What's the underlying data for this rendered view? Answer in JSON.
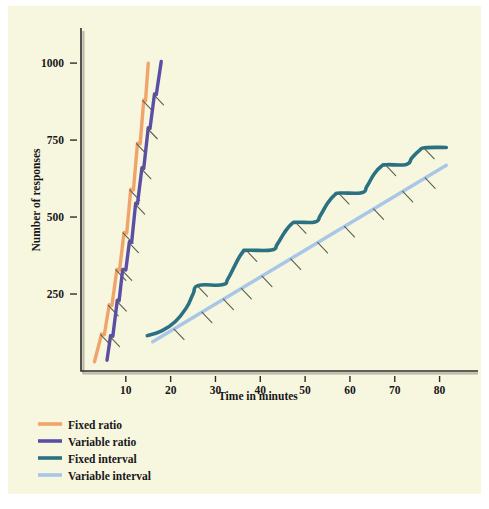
{
  "figure": {
    "background_color": "#f7f6de",
    "page_color": "#ffffff",
    "text_color": "#17171a"
  },
  "chart_data": {
    "type": "line",
    "title": "",
    "subtitle": "",
    "xlabel": "Time in minutes",
    "ylabel": "Number of responses",
    "xlim": [
      0,
      85
    ],
    "ylim": [
      0,
      1075
    ],
    "xticks": [
      10,
      20,
      30,
      40,
      50,
      60,
      70,
      80
    ],
    "xtick_labels": [
      "10",
      "20",
      "30",
      "40",
      "50",
      "60",
      "70",
      "80"
    ],
    "yticks": [
      250,
      500,
      750,
      1000
    ],
    "ytick_labels": [
      "250",
      "500",
      "750",
      "1000"
    ],
    "grid": false,
    "legend_position": "below-left",
    "annotation": "Short diagonal hatch marks on each curve indicate moments of reinforcement",
    "series": [
      {
        "name": "Fixed ratio",
        "color": "#f0a46a",
        "width": 3.4,
        "shape": "steep-straight-with-pauses",
        "points": [
          [
            3.0,
            30
          ],
          [
            4.6,
            120
          ],
          [
            5.2,
            118
          ],
          [
            6.3,
            215
          ],
          [
            6.9,
            213
          ],
          [
            8.0,
            330
          ],
          [
            8.6,
            328
          ],
          [
            9.6,
            450
          ],
          [
            10.2,
            448
          ],
          [
            11.1,
            590
          ],
          [
            11.7,
            588
          ],
          [
            12.6,
            740
          ],
          [
            13.2,
            738
          ],
          [
            14.0,
            880
          ],
          [
            14.4,
            878
          ],
          [
            15.0,
            1000
          ]
        ],
        "reinforcement_marks": [
          [
            4.6,
            120
          ],
          [
            6.3,
            215
          ],
          [
            8.0,
            330
          ],
          [
            9.6,
            450
          ],
          [
            11.1,
            590
          ],
          [
            12.6,
            740
          ],
          [
            14.0,
            880
          ]
        ]
      },
      {
        "name": "Variable ratio",
        "color": "#5b4fa5",
        "width": 3.4,
        "shape": "steep-straight-steady",
        "points": [
          [
            5.8,
            35
          ],
          [
            6.6,
            115
          ],
          [
            7.1,
            113
          ],
          [
            8.1,
            230
          ],
          [
            8.5,
            228
          ],
          [
            9.3,
            330
          ],
          [
            10.0,
            328
          ],
          [
            10.8,
            420
          ],
          [
            11.3,
            418
          ],
          [
            12.2,
            545
          ],
          [
            12.6,
            543
          ],
          [
            13.6,
            660
          ],
          [
            14.0,
            658
          ],
          [
            15.0,
            790
          ],
          [
            15.4,
            788
          ],
          [
            16.4,
            900
          ],
          [
            16.8,
            898
          ],
          [
            17.9,
            1005
          ]
        ],
        "reinforcement_marks": [
          [
            6.6,
            115
          ],
          [
            8.1,
            230
          ],
          [
            9.3,
            330
          ],
          [
            10.8,
            420
          ],
          [
            12.2,
            545
          ],
          [
            13.6,
            660
          ],
          [
            15.0,
            790
          ],
          [
            16.4,
            900
          ]
        ]
      },
      {
        "name": "Fixed interval",
        "color": "#2a7183",
        "width": 3.6,
        "shape": "scalloped",
        "points": [
          [
            14.8,
            115
          ],
          [
            18.0,
            130
          ],
          [
            21.0,
            160
          ],
          [
            23.5,
            205
          ],
          [
            25.0,
            250
          ],
          [
            26.2,
            278
          ],
          [
            31.5,
            280
          ],
          [
            32.8,
            300
          ],
          [
            34.4,
            345
          ],
          [
            36.0,
            385
          ],
          [
            37.2,
            392
          ],
          [
            42.5,
            393
          ],
          [
            43.8,
            412
          ],
          [
            45.4,
            450
          ],
          [
            47.0,
            478
          ],
          [
            48.2,
            483
          ],
          [
            52.2,
            484
          ],
          [
            53.4,
            505
          ],
          [
            55.0,
            545
          ],
          [
            56.6,
            572
          ],
          [
            57.8,
            578
          ],
          [
            62.6,
            579
          ],
          [
            63.8,
            600
          ],
          [
            65.4,
            640
          ],
          [
            67.0,
            665
          ],
          [
            68.2,
            670
          ],
          [
            72.6,
            671
          ],
          [
            73.8,
            692
          ],
          [
            75.4,
            715
          ],
          [
            76.8,
            725
          ],
          [
            81.5,
            726
          ]
        ],
        "reinforcement_marks": [
          [
            26.2,
            278
          ],
          [
            37.2,
            392
          ],
          [
            48.2,
            483
          ],
          [
            57.8,
            578
          ],
          [
            68.2,
            670
          ],
          [
            76.8,
            725
          ]
        ]
      },
      {
        "name": "Variable interval",
        "color": "#a8c7e8",
        "width": 3.4,
        "shape": "straight-steady",
        "points": [
          [
            16.0,
            95
          ],
          [
            81.5,
            668
          ]
        ],
        "reinforcement_marks": [
          [
            21.0,
            138
          ],
          [
            27.2,
            193
          ],
          [
            32.0,
            235
          ],
          [
            36.0,
            270
          ],
          [
            40.6,
            310
          ],
          [
            47.0,
            366
          ],
          [
            53.0,
            419
          ],
          [
            59.0,
            471
          ],
          [
            65.5,
            528
          ],
          [
            72.0,
            585
          ],
          [
            77.0,
            629
          ]
        ]
      }
    ]
  },
  "legend": {
    "items": [
      {
        "label": "Fixed ratio",
        "color": "#f0a46a"
      },
      {
        "label": "Variable ratio",
        "color": "#5b4fa5"
      },
      {
        "label": "Fixed interval",
        "color": "#2a7183"
      },
      {
        "label": "Variable interval",
        "color": "#a8c7e8"
      }
    ]
  }
}
